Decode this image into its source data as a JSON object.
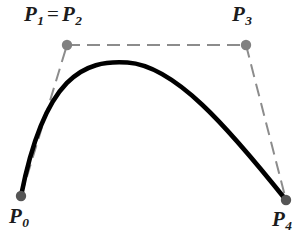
{
  "figure": {
    "background_color": "#ffffff",
    "width": 298,
    "height": 233
  },
  "labels": {
    "p0": {
      "base": "P",
      "sub": "0"
    },
    "p1p2": {
      "base_a": "P",
      "sub_a": "1",
      "equals": "=",
      "base_b": "P",
      "sub_b": "2"
    },
    "p3": {
      "base": "P",
      "sub": "3"
    },
    "p4": {
      "base": "P",
      "sub": "4"
    }
  },
  "style": {
    "curve_color": "#000000",
    "curve_width": 4.6,
    "polygon_color": "#8c8c8c",
    "polygon_width": 2,
    "polygon_dash": "13 7",
    "point_color": "#808080",
    "point_radius": 5.2,
    "endpoint_color": "#555555",
    "label_color": "#1b1b1b"
  },
  "chart_data": {
    "type": "line",
    "xlabel": "",
    "ylabel": "",
    "xlim": [
      0,
      298
    ],
    "ylim": [
      233,
      0
    ],
    "grid": false,
    "legend": "none",
    "annotations": [
      "P_0",
      "P_1 = P_2",
      "P_3",
      "P_4"
    ],
    "control_points": [
      {
        "name": "P0",
        "x": 21,
        "y": 196,
        "kind": "endpoint",
        "label": "P0"
      },
      {
        "name": "P1",
        "x": 67,
        "y": 45,
        "kind": "control",
        "label": "P1 = P2",
        "coincident_with": "P2"
      },
      {
        "name": "P2",
        "x": 67,
        "y": 45,
        "kind": "control",
        "label": "P1 = P2",
        "coincident_with": "P1"
      },
      {
        "name": "P3",
        "x": 246,
        "y": 45,
        "kind": "control",
        "label": "P3"
      },
      {
        "name": "P4",
        "x": 286,
        "y": 200,
        "kind": "endpoint",
        "label": "P4"
      }
    ],
    "control_polygon": [
      [
        21,
        196
      ],
      [
        67,
        45
      ],
      [
        246,
        45
      ],
      [
        286,
        200
      ]
    ],
    "curve_degree": 4,
    "curve_path": "M 21 196 C 44.8 75.4 84.2 59.6 127.5 62.5 C 174.5 65.7 226.8 126.0 286 200",
    "curve_samples": [
      [
        21,
        196
      ],
      [
        30,
        166
      ],
      [
        41,
        137
      ],
      [
        54,
        113
      ],
      [
        70,
        92
      ],
      [
        88,
        76
      ],
      [
        108,
        66
      ],
      [
        128,
        62
      ],
      [
        150,
        64
      ],
      [
        172,
        72
      ],
      [
        196,
        90
      ],
      [
        220,
        116
      ],
      [
        246,
        150
      ],
      [
        268,
        177
      ],
      [
        286,
        200
      ]
    ]
  }
}
